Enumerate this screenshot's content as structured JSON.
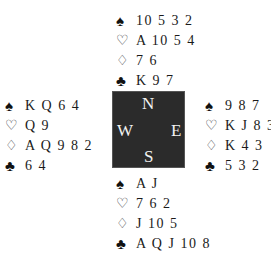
{
  "suits": {
    "spades": "♠",
    "hearts": "♡",
    "diamonds": "♢",
    "clubs": "♣"
  },
  "compass": {
    "north": "N",
    "south": "S",
    "east": "E",
    "west": "W",
    "background": "#2b2b2b"
  },
  "hands": {
    "north": {
      "spades": "10 5 3 2",
      "hearts": "A 10 5 4",
      "diamonds": "7 6",
      "clubs": "K 9 7"
    },
    "west": {
      "spades": "K Q 6 4",
      "hearts": "Q 9",
      "diamonds": "A Q 9 8 2",
      "clubs": "6 4"
    },
    "east": {
      "spades": "9 8 7",
      "hearts": "K J 8 3",
      "diamonds": "K 4 3",
      "clubs": "5 3 2"
    },
    "south": {
      "spades": "A J",
      "hearts": "7 6 2",
      "diamonds": "J 10 5",
      "clubs": "A Q J 10 8"
    }
  }
}
